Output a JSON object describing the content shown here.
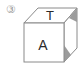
{
  "diagram": {
    "option_label": "③",
    "cube": {
      "top_face_letter": "T",
      "front_face_letter": "A",
      "right_face_marks": [
        "shaded-triangle-top",
        "shaded-triangle-bottom"
      ]
    },
    "colors": {
      "stroke": "#8a8a8a",
      "shade": "#9c9c9c",
      "text": "#2a2a2a",
      "label": "#9a9a9a"
    }
  }
}
